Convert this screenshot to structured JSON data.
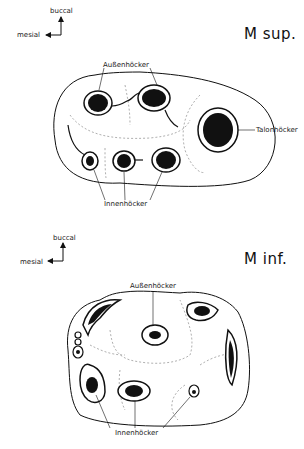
{
  "upper": {
    "title": "M sup.",
    "orientation": {
      "vertical": "buccal",
      "horizontal": "mesial"
    },
    "labels": {
      "outer_cusp": "Außenhöcker",
      "talon_cusp": "Talonhöcker",
      "inner_cusp": "Innenhöcker"
    }
  },
  "lower": {
    "title": "M inf.",
    "orientation": {
      "vertical": "buccal",
      "horizontal": "mesial"
    },
    "labels": {
      "outer_cusp": "Außenhöcker",
      "inner_cusp": "Innenhöcker"
    }
  },
  "colors": {
    "ink": "#111111",
    "dash": "#9a9a9a",
    "background": "#ffffff"
  }
}
